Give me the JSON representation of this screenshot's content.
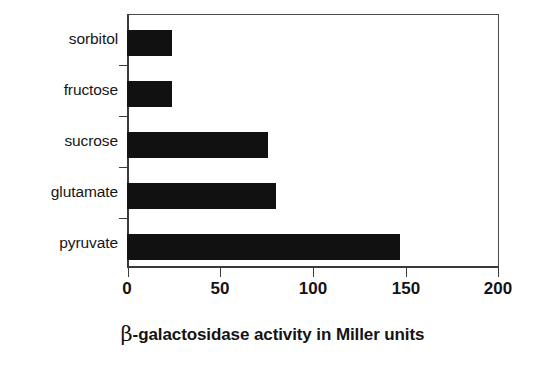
{
  "chart_data": {
    "type": "bar",
    "orientation": "horizontal",
    "title": "",
    "subtitle": "",
    "xlabel": "β-galactosidase activity in Miller units",
    "ylabel": "",
    "categories": [
      "sorbitol",
      "fructose",
      "sucrose",
      "glutamate",
      "pyruvate"
    ],
    "values": [
      24,
      24,
      76,
      80,
      147
    ],
    "series": [
      {
        "name": "β-galactosidase activity",
        "values": [
          24,
          24,
          76,
          80,
          147
        ]
      }
    ],
    "xlim": [
      0,
      200
    ],
    "xticks": [
      0,
      50,
      100,
      150,
      200
    ],
    "xtick_labels": [
      "0",
      "50",
      "100",
      "150",
      "200"
    ],
    "grid": false,
    "legend": false,
    "legend_position": "none",
    "bar_color": "#111111",
    "axis_color": "#3a3a3a",
    "background_color": "#ffffff"
  },
  "axis_title": {
    "symbol": "β",
    "rest": "-galactosidase activity in Miller units"
  }
}
